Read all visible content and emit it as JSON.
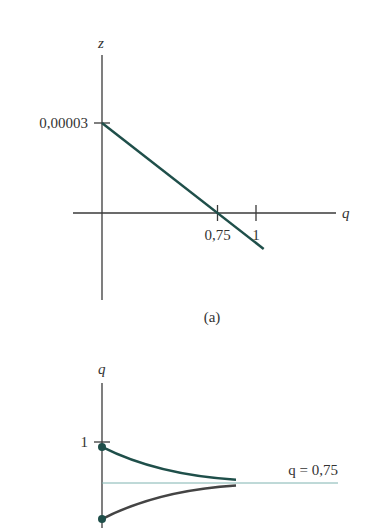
{
  "chart_data": [
    {
      "type": "line",
      "panel_label": "(a)",
      "xlabel": "q",
      "ylabel": "z",
      "x_ticks": [
        {
          "value": 0.75,
          "label": "0,75"
        },
        {
          "value": 1,
          "label": "1"
        }
      ],
      "y_ticks": [
        {
          "value": 3e-05,
          "label": "0,00003"
        }
      ],
      "xlim": [
        -0.2,
        1.6
      ],
      "ylim": [
        -2e-05,
        4e-05
      ],
      "series": [
        {
          "name": "z(q)",
          "color": "#1f4f4a",
          "x": [
            0,
            1.05
          ],
          "y": [
            3e-05,
            -1.2e-05
          ]
        }
      ],
      "grid": false
    },
    {
      "type": "line",
      "ylabel": "q",
      "y_ticks": [
        {
          "value": 1,
          "label": "1"
        }
      ],
      "ylim": [
        0,
        1.35
      ],
      "xlim": [
        0,
        1
      ],
      "reference_line": {
        "value": 0.75,
        "label": "q = 0,75",
        "color": "#7fb3b0"
      },
      "series": [
        {
          "name": "upper-trajectory",
          "color": "#1f4f4a",
          "start": 0.97,
          "end": 0.77
        },
        {
          "name": "lower-trajectory",
          "color": "#444444",
          "start": 0.53,
          "end": 0.735
        }
      ],
      "grid": false
    }
  ]
}
